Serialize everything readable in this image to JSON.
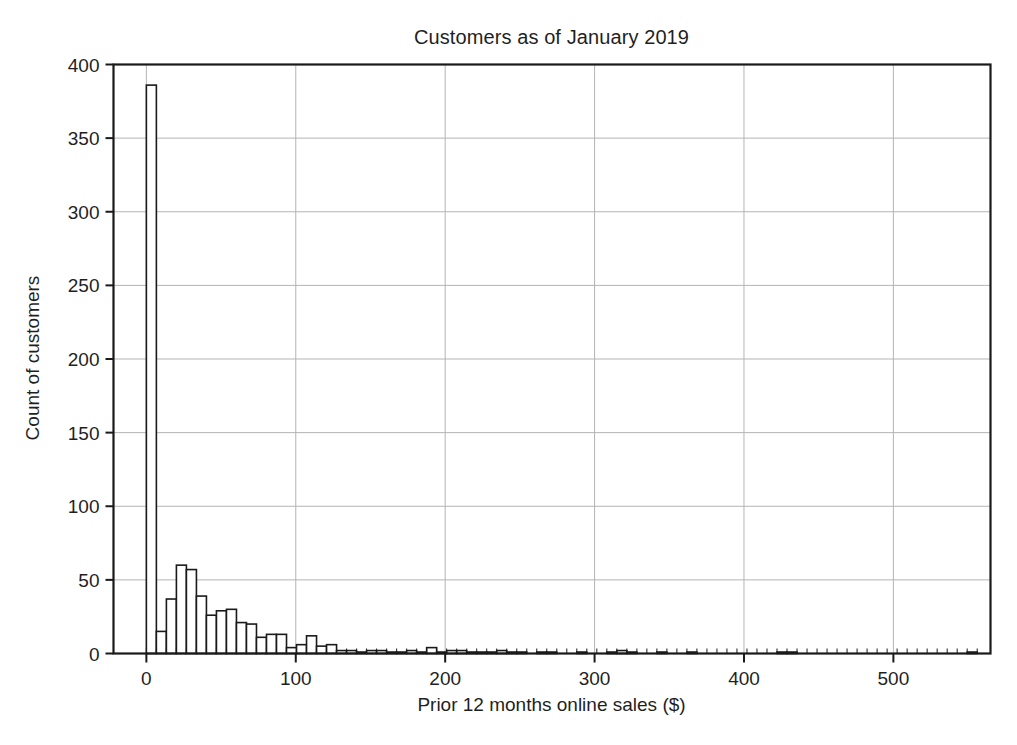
{
  "chart_data": {
    "type": "bar",
    "title": "Customers as of January 2019",
    "xlabel": "Prior 12 months online sales ($)",
    "ylabel": "Count of customers",
    "grid": true,
    "legend": null,
    "xlim": [
      -22,
      565
    ],
    "ylim": [
      0,
      400
    ],
    "xticks": [
      0,
      100,
      200,
      300,
      400,
      500
    ],
    "xtick_labels": [
      "0",
      "100",
      "200",
      "300",
      "400",
      "500"
    ],
    "yticks": [
      0,
      50,
      100,
      150,
      200,
      250,
      300,
      350,
      400
    ],
    "ytick_labels": [
      "0",
      "50",
      "100",
      "150",
      "200",
      "250",
      "300",
      "350",
      "400"
    ],
    "bin_width": 6.7,
    "bin_starts": [
      0,
      6.7,
      13.4,
      20.1,
      26.8,
      33.5,
      40.2,
      46.9,
      53.6,
      60.3,
      67,
      73.7,
      80.4,
      87.1,
      93.8,
      100.5,
      107.2,
      113.9,
      120.6,
      127.3,
      134,
      140.7,
      147.4,
      154.1,
      160.8,
      167.5,
      174.2,
      180.9,
      187.6,
      194.3,
      201,
      207.7,
      214.4,
      221.1,
      227.8,
      234.5,
      241.2,
      247.9,
      254.6,
      261.3,
      268,
      274.7,
      281.4,
      288.1,
      294.8,
      301.5,
      308.2,
      314.9,
      321.6,
      328.3,
      335,
      341.7,
      348.4,
      355.1,
      361.8,
      368.5,
      375.2,
      381.9,
      388.6,
      395.3,
      402,
      408.7,
      415.4,
      422.1,
      428.8,
      435.5,
      442.2,
      448.9,
      455.6,
      462.3,
      469,
      475.7,
      482.4,
      489.1,
      495.8,
      502.5,
      509.2,
      515.9,
      522.6,
      529.3,
      536,
      542.7,
      549.4,
      556.1
    ],
    "values": [
      386,
      15,
      37,
      60,
      57,
      39,
      26,
      29,
      30,
      21,
      20,
      11,
      13,
      13,
      4,
      6,
      12,
      5,
      6,
      2,
      2,
      1,
      2,
      2,
      1,
      1,
      2,
      1,
      4,
      1,
      2,
      2,
      1,
      1,
      1,
      2,
      1,
      1,
      0,
      1,
      1,
      0,
      0,
      1,
      0,
      0,
      1,
      2,
      1,
      0,
      0,
      1,
      0,
      0,
      1,
      0,
      0,
      0,
      0,
      0,
      0,
      0,
      0,
      1,
      1,
      0,
      0,
      0,
      0,
      0,
      0,
      0,
      0,
      0,
      0,
      0,
      0,
      0,
      0,
      0,
      0,
      0,
      1,
      0
    ],
    "peak_value": 386,
    "peak_bin": "0 to 6.7",
    "bar_edge_color": "#1a1a1a",
    "bar_fill_color": "#ffffff",
    "grid_color": "#b4b4b4",
    "axis_color": "#1a1a1a",
    "background_color": "#ffffff"
  }
}
